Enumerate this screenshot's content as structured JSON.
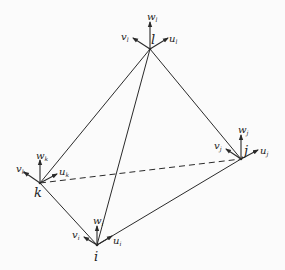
{
  "diagram": {
    "type": "tetrahedral element with nodal displacement components",
    "background": "#fbfbfb",
    "line_color": "#2a2a2a",
    "nodes": [
      {
        "id": "l",
        "label": "l",
        "x": 150,
        "y": 49,
        "dof": {
          "w": "w",
          "w_sub": "l",
          "v": "v",
          "v_sub": "l",
          "u": "u",
          "u_sub": "l"
        }
      },
      {
        "id": "k",
        "label": "k",
        "x": 40,
        "y": 183,
        "dof": {
          "w": "w",
          "w_sub": "k",
          "v": "v",
          "v_sub": "k",
          "u": "u",
          "u_sub": "k"
        }
      },
      {
        "id": "j",
        "label": "j",
        "x": 241,
        "y": 159,
        "dof": {
          "w": "w",
          "w_sub": "j",
          "v": "v",
          "v_sub": "j",
          "u": "u",
          "u_sub": "j"
        }
      },
      {
        "id": "i",
        "label": "i",
        "x": 97,
        "y": 245,
        "dof": {
          "w": "w",
          "w_sub": "i",
          "v": "v",
          "v_sub": "i",
          "u": "u",
          "u_sub": "i"
        }
      }
    ],
    "edges": [
      {
        "from": "l",
        "to": "k",
        "style": "solid"
      },
      {
        "from": "l",
        "to": "i",
        "style": "solid"
      },
      {
        "from": "l",
        "to": "j",
        "style": "solid"
      },
      {
        "from": "k",
        "to": "i",
        "style": "solid"
      },
      {
        "from": "i",
        "to": "j",
        "style": "solid"
      },
      {
        "from": "k",
        "to": "j",
        "style": "dashed"
      }
    ]
  }
}
